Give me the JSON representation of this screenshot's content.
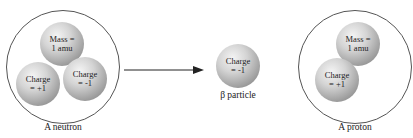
{
  "neutron": {
    "caption": "A neutron",
    "particles": [
      {
        "label": "Mass =\n1 amu"
      },
      {
        "label": "Charge\n= +1"
      },
      {
        "label": "Charge\n= -1"
      }
    ]
  },
  "beta": {
    "caption": "β particle",
    "label": "Charge\n= -1"
  },
  "proton": {
    "caption": "A proton",
    "particles": [
      {
        "label": "Mass =\n1 amu"
      },
      {
        "label": "Charge\n= +1"
      }
    ]
  }
}
